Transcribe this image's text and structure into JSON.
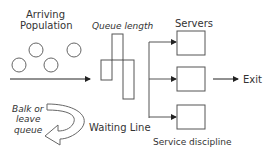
{
  "diagram": {
    "labels": {
      "arriving_population_line1": "Arriving",
      "arriving_population_line2": "Population",
      "queue_length": "Queue length",
      "servers": "Servers",
      "exit": "Exit",
      "balk_line1": "Balk or",
      "balk_line2": "leave",
      "balk_line3": "queue",
      "waiting_line": "Waiting Line",
      "service_discipline": "Service discipline"
    },
    "population_circles": 4,
    "queue_bars": 3,
    "server_count": 3,
    "stroke_color": "#555555"
  }
}
